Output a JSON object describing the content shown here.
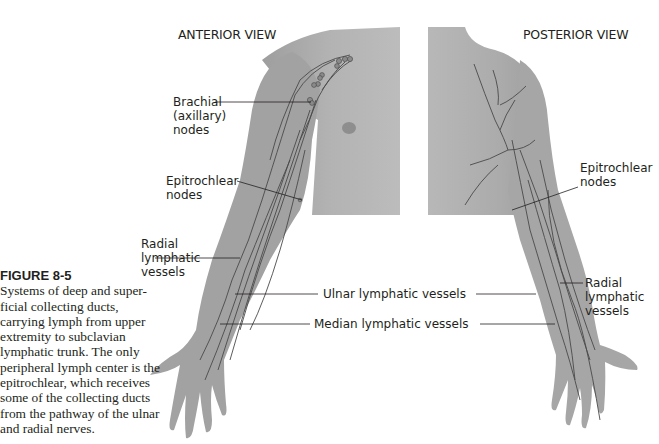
{
  "figure": {
    "number": "FIGURE 8-5",
    "caption": "Systems of deep and superficial collecting ducts, carrying lymph from upper extremity to subclavian lymphatic trunk. The only peripheral lymph center is the epitrochlear, which receives some of the collecting ducts from the pathway of the ulnar and radial nerves.",
    "caption_lines": [
      "Systems of deep and super-",
      "ficial collecting ducts,",
      "carrying lymph from upper",
      "extremity to subclavian",
      "lymphatic trunk. The only",
      "peripheral lymph center is the",
      "epitrochlear, which receives",
      "some of the collecting ducts",
      "from the pathway of the ulnar",
      "and radial nerves."
    ]
  },
  "views": {
    "anterior": {
      "title": "ANTERIOR VIEW",
      "labels": {
        "brachial": [
          "Brachial",
          "(axillary)",
          "nodes"
        ],
        "epitrochlear": [
          "Epitrochlear",
          "nodes"
        ],
        "radial": [
          "Radial",
          "lymphatic",
          "vessels"
        ]
      }
    },
    "posterior": {
      "title": "POSTERIOR VIEW",
      "labels": {
        "epitrochlear": [
          "Epitrochlear",
          "nodes"
        ],
        "radial": [
          "Radial",
          "lymphatic",
          "vessels"
        ]
      }
    }
  },
  "shared_labels": {
    "ulnar": "Ulnar lymphatic vessels",
    "median": "Median lymphatic vessels"
  },
  "colors": {
    "skin": "#a8a8a8",
    "skin_light": "#bdbdbd",
    "vessel": "#4a4a4a",
    "text": "#231f20",
    "leader": "#231f20"
  }
}
